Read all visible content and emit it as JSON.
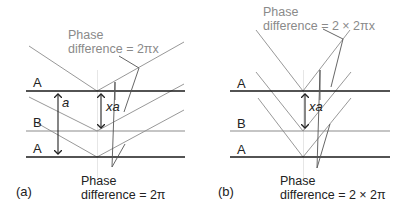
{
  "panels": [
    {
      "id": "a",
      "caption": "(a)",
      "layers": [
        {
          "label": "A",
          "y": 91,
          "weight": "thick"
        },
        {
          "label": "B",
          "y": 131,
          "weight": "thin"
        },
        {
          "label": "A",
          "y": 157,
          "weight": "thick"
        }
      ],
      "spacing_label": "a",
      "offset_label": "xa",
      "top_note": {
        "line1": "Phase",
        "line2": "difference = 2πx"
      },
      "bottom_note": {
        "line1": "Phase",
        "line2": "difference = 2π"
      }
    },
    {
      "id": "b",
      "caption": "(b)",
      "layers": [
        {
          "label": "A",
          "y": 91,
          "weight": "thick"
        },
        {
          "label": "B",
          "y": 131,
          "weight": "thin"
        },
        {
          "label": "A",
          "y": 157,
          "weight": "thick"
        }
      ],
      "offset_label": "xa",
      "top_note": {
        "line1": "Phase",
        "line2": "difference = 2 × 2πx"
      },
      "bottom_note": {
        "line1": "Phase",
        "line2": "difference = 2 × 2π"
      }
    }
  ],
  "colors": {
    "layer_thick": "#1a1a1a",
    "layer_thin": "#8c8c8c",
    "ray": "#8c8c8c",
    "arrow": "#222222",
    "guide": "#e6e6e6",
    "note_gray": "#8a8a8a"
  }
}
